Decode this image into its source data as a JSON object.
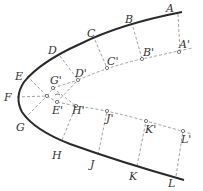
{
  "diagram": {
    "colors": {
      "curve": "#2a2a2a",
      "dashed": "#8a8a8a",
      "label": "#333333"
    },
    "outer_points": [
      {
        "id": "A",
        "label": "A"
      },
      {
        "id": "B",
        "label": "B"
      },
      {
        "id": "C",
        "label": "C"
      },
      {
        "id": "D",
        "label": "D"
      },
      {
        "id": "E",
        "label": "E"
      },
      {
        "id": "F",
        "label": "F"
      },
      {
        "id": "G",
        "label": "G"
      },
      {
        "id": "H",
        "label": "H"
      },
      {
        "id": "J",
        "label": "J"
      },
      {
        "id": "K",
        "label": "K"
      },
      {
        "id": "L",
        "label": "L"
      }
    ],
    "inner_points": [
      {
        "id": "A'",
        "label": "A'"
      },
      {
        "id": "B'",
        "label": "B'"
      },
      {
        "id": "C'",
        "label": "C'"
      },
      {
        "id": "D'",
        "label": "D'"
      },
      {
        "id": "G'",
        "label": "G'"
      },
      {
        "id": "E'",
        "label": "E'"
      },
      {
        "id": "H'",
        "label": "H'"
      },
      {
        "id": "J'",
        "label": "J'"
      },
      {
        "id": "K'",
        "label": "K'"
      },
      {
        "id": "L'",
        "label": "L'"
      }
    ]
  }
}
